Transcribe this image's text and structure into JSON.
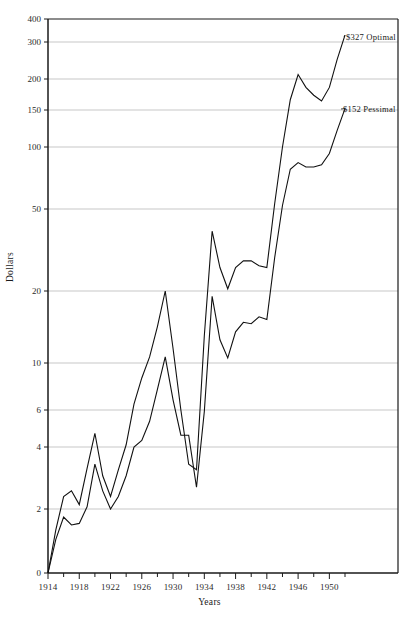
{
  "chart_data": {
    "type": "line",
    "title": "",
    "xlabel": "Years",
    "ylabel": "Dollars",
    "yscale": "log-like-custom",
    "grid": true,
    "legend_position": "inline-right-annotations",
    "xlim": [
      1914,
      1952
    ],
    "ylim": [
      0,
      400
    ],
    "y_ticks": [
      0,
      2,
      4,
      6,
      10,
      20,
      50,
      100,
      150,
      200,
      300,
      400
    ],
    "y_tick_labels": [
      "0",
      "2",
      "4",
      "6",
      "10",
      "20",
      "50",
      "100",
      "150",
      "200",
      "300",
      "400"
    ],
    "x_ticks_major": [
      1914,
      1918,
      1922,
      1926,
      1930,
      1934,
      1938,
      1942,
      1946,
      1950
    ],
    "x_tick_labels": [
      "1914",
      "1918",
      "1922",
      "1926",
      "1930",
      "1934",
      "1938",
      "1942",
      "1946",
      "1950"
    ],
    "x_ticks_minor": [
      1916,
      1920,
      1924,
      1928,
      1932,
      1936,
      1940,
      1944,
      1948,
      1952
    ],
    "series": [
      {
        "name": "Optimal",
        "end_label": "$327  Optimal",
        "end_value": 327,
        "x": [
          1914,
          1915,
          1916,
          1917,
          1918,
          1919,
          1920,
          1921,
          1922,
          1923,
          1924,
          1925,
          1926,
          1927,
          1928,
          1929,
          1930,
          1931,
          1932,
          1933,
          1934,
          1935,
          1936,
          1937,
          1938,
          1939,
          1940,
          1941,
          1942,
          1943,
          1944,
          1945,
          1946,
          1947,
          1948,
          1949,
          1950,
          1951,
          1952
        ],
        "values": [
          0.0,
          1.35,
          2.3,
          2.45,
          2.1,
          3.15,
          4.65,
          2.9,
          2.3,
          3.1,
          4.1,
          6.4,
          8.5,
          10.6,
          14.2,
          20.0,
          11.5,
          6.0,
          3.3,
          3.1,
          13.0,
          39.0,
          26.0,
          20.5,
          26.0,
          28.0,
          28.0,
          26.5,
          26.0,
          53.0,
          100.0,
          165.0,
          210.0,
          185.0,
          172.0,
          163.0,
          185.0,
          248.0,
          327.0
        ]
      },
      {
        "name": "Pessimal",
        "end_label": "$152  Pessimal",
        "end_value": 152,
        "x": [
          1914,
          1915,
          1916,
          1917,
          1918,
          1919,
          1920,
          1921,
          1922,
          1923,
          1924,
          1925,
          1926,
          1927,
          1928,
          1929,
          1930,
          1931,
          1932,
          1933,
          1934,
          1935,
          1936,
          1937,
          1938,
          1939,
          1940,
          1941,
          1942,
          1943,
          1944,
          1945,
          1946,
          1947,
          1948,
          1949,
          1950,
          1951,
          1952
        ],
        "values": [
          0.0,
          1.05,
          1.75,
          1.5,
          1.55,
          2.05,
          3.3,
          2.45,
          2.0,
          2.3,
          2.9,
          4.0,
          4.3,
          5.3,
          7.5,
          10.6,
          6.7,
          4.55,
          4.55,
          2.55,
          5.9,
          19.0,
          12.5,
          10.5,
          13.5,
          14.8,
          14.6,
          15.6,
          15.2,
          29.0,
          52.0,
          78.0,
          84.0,
          80.0,
          80.0,
          82.0,
          93.0,
          120.0,
          152.0
        ]
      }
    ]
  }
}
